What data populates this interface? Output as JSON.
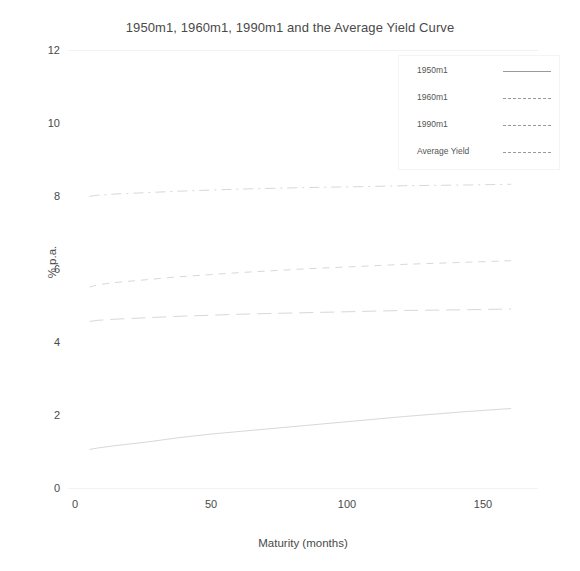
{
  "figure": {
    "title": "1950m1, 1960m1, 1990m1 and the Average Yield Curve",
    "background": "#ffffff",
    "ink_color": "#4a4a4a",
    "curve_color": "#d8d8d8"
  },
  "axes": {
    "ylabel": "% p.a.",
    "xlabel": "Maturity (months)",
    "yticks": [
      "0",
      "2",
      "4",
      "6",
      "8",
      "10",
      "12"
    ],
    "xticks": [
      "0",
      "50",
      "100",
      "150"
    ]
  },
  "legend": {
    "entries": [
      {
        "label": "1950m1",
        "style": "solid"
      },
      {
        "label": "1960m1",
        "style": "dashed"
      },
      {
        "label": "1990m1",
        "style": "dashdot"
      },
      {
        "label": "Average Yield",
        "style": "longdash"
      }
    ]
  },
  "chart_data": {
    "type": "line",
    "title": "1950m1, 1960m1, 1990m1 and the Average Yield Curve",
    "xlabel": "Maturity (months)",
    "ylabel": "% p.a.",
    "xlim": [
      -5,
      170
    ],
    "ylim": [
      0,
      12
    ],
    "xticks": [
      0,
      50,
      100,
      150
    ],
    "yticks": [
      0,
      2,
      4,
      6,
      8,
      10,
      12
    ],
    "grid": false,
    "legend_position": "upper right",
    "x": [
      3,
      6,
      12,
      24,
      36,
      48,
      60,
      84,
      108,
      120,
      144,
      160
    ],
    "series": [
      {
        "name": "1950m1",
        "style": "solid",
        "values": [
          1.08,
          1.12,
          1.18,
          1.28,
          1.4,
          1.5,
          1.58,
          1.74,
          1.9,
          1.98,
          2.12,
          2.2
        ]
      },
      {
        "name": "1960m1",
        "style": "dashed",
        "values": [
          5.52,
          5.58,
          5.64,
          5.72,
          5.8,
          5.86,
          5.92,
          6.02,
          6.1,
          6.14,
          6.2,
          6.24
        ]
      },
      {
        "name": "1990m1",
        "style": "dashdot",
        "values": [
          8.0,
          8.03,
          8.06,
          8.1,
          8.14,
          8.17,
          8.2,
          8.24,
          8.27,
          8.29,
          8.31,
          8.33
        ]
      },
      {
        "name": "Average Yield",
        "style": "longdash",
        "values": [
          4.58,
          4.61,
          4.64,
          4.68,
          4.72,
          4.75,
          4.78,
          4.82,
          4.86,
          4.88,
          4.9,
          4.92
        ]
      }
    ]
  }
}
